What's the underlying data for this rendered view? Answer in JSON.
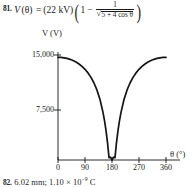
{
  "problem": {
    "number": "81.",
    "equation": {
      "lhs_function": "V",
      "lhs_variable": "(θ)",
      "equals": "=",
      "coefficient": "(22 kV)",
      "one_outer": "1",
      "minus": "−",
      "fraction_numerator": "1",
      "radical_sign": "√",
      "radical_body": "5 + 4 cos θ",
      "full_text": "81. V(θ) = (22 kV)(1 − 1/√(5 + 4 cos θ))"
    }
  },
  "chart_data": {
    "type": "line",
    "title": "",
    "xlabel": "θ (°)",
    "ylabel": "V (V)",
    "xlim": [
      0,
      380
    ],
    "ylim": [
      0,
      16500
    ],
    "grid": false,
    "legend": null,
    "x_ticks": [
      {
        "value": 0,
        "label": "0"
      },
      {
        "value": 90,
        "label": "90"
      },
      {
        "value": 180,
        "label": "180"
      },
      {
        "value": 270,
        "label": "270"
      },
      {
        "value": 360,
        "label": "360"
      }
    ],
    "y_ticks": [
      {
        "value": 7500,
        "label": "7,500"
      },
      {
        "value": 15000,
        "label": "15,000"
      }
    ],
    "series": [
      {
        "name": "V(θ) = (22 kV)(1 − 1/√(5 + 4 cos θ))",
        "color": "#141414",
        "x": [
          0,
          10,
          20,
          30,
          40,
          50,
          60,
          70,
          80,
          90,
          100,
          110,
          120,
          130,
          140,
          150,
          155,
          160,
          165,
          170,
          175,
          180,
          185,
          190,
          195,
          200,
          205,
          210,
          220,
          230,
          240,
          250,
          260,
          270,
          280,
          290,
          300,
          310,
          320,
          330,
          340,
          350,
          360
        ],
        "y": [
          14667,
          14650,
          14598,
          14510,
          14383,
          14213,
          13994,
          13719,
          13378,
          12958,
          12441,
          11801,
          11000,
          9977,
          8635,
          6802,
          5629,
          4220,
          2494,
          332,
          402,
          0,
          402,
          332,
          2494,
          4220,
          5629,
          6802,
          8635,
          9977,
          11000,
          11801,
          12441,
          12958,
          13378,
          13719,
          13994,
          14213,
          14383,
          14510,
          14598,
          14650,
          14667
        ]
      }
    ],
    "annotations": {
      "minimum": {
        "x": 180,
        "y": 0
      },
      "maximum": {
        "x": 0,
        "y": 14667
      }
    }
  },
  "next_problem": {
    "number": "82.",
    "text_part1": "6.02 mm; 1.10 × 10",
    "exponent": "−9",
    "text_part2": " C"
  }
}
